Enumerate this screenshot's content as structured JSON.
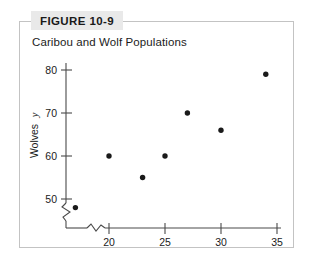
{
  "figure": {
    "banner_label": "FIGURE 10-9",
    "title": "Caribou and Wolf Populations",
    "frame_color": "#c3c3c3",
    "banner_color": "#e9e9e9"
  },
  "chart_data": {
    "type": "scatter",
    "title": "Caribou and Wolf Populations",
    "xlabel": "Caribou (100's)",
    "xvar": "x",
    "ylabel": "Wolves",
    "yvar": "y",
    "xlim": [
      15,
      35
    ],
    "ylim": [
      46,
      82
    ],
    "xticks": [
      20,
      25,
      30,
      35
    ],
    "yticks": [
      50,
      60,
      70,
      80
    ],
    "xtick_labels": [
      "20",
      "25",
      "30",
      "35"
    ],
    "ytick_labels": [
      "50",
      "60",
      "70",
      "80"
    ],
    "grid": false,
    "legend": false,
    "axis_break_x": true,
    "axis_break_y": true,
    "marker_color": "#1a1a1a",
    "points": [
      {
        "x": 17,
        "y": 48
      },
      {
        "x": 20,
        "y": 60
      },
      {
        "x": 23,
        "y": 55
      },
      {
        "x": 25,
        "y": 60
      },
      {
        "x": 27,
        "y": 70
      },
      {
        "x": 30,
        "y": 66
      },
      {
        "x": 34,
        "y": 79
      }
    ]
  }
}
